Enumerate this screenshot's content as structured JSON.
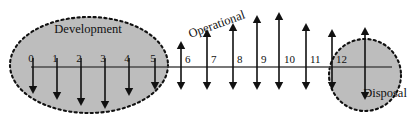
{
  "diagram": {
    "width": 416,
    "height": 126,
    "background_color": "#ffffff",
    "ink_color": "#111111",
    "axis_color": "#4a4a4a",
    "phase_fill_color": "#bdbdbd",
    "phase_border_style": "dashed"
  },
  "axis": {
    "name": "lifecycle-timeline-axis",
    "y": 67,
    "x_start": 31,
    "x_end": 392
  },
  "phases": [
    {
      "id": "development",
      "label": "Development",
      "shape": "ellipse",
      "cx": 89,
      "cy": 65,
      "rx": 79,
      "ry": 48,
      "label_x": 88,
      "label_y": 33,
      "label_rotation": 0
    },
    {
      "id": "operational",
      "label": "Operational",
      "shape": "none",
      "label_x": 218,
      "label_y": 28,
      "label_rotation": -20
    },
    {
      "id": "disposal",
      "label": "Disposal",
      "shape": "circle",
      "cx": 365,
      "cy": 75,
      "rx": 36,
      "ry": 36,
      "label_x": 385,
      "label_y": 97,
      "label_rotation": 0
    }
  ],
  "ticks": [
    {
      "label": "0",
      "x": 33,
      "label_x": 31,
      "label_y": 62,
      "arrow_type": "down",
      "up_length": 0,
      "down_length": 27,
      "phase": "development"
    },
    {
      "label": "1",
      "x": 57,
      "label_x": 55,
      "label_y": 62,
      "arrow_type": "down",
      "up_length": 0,
      "down_length": 33,
      "phase": "development"
    },
    {
      "label": "2",
      "x": 81,
      "label_x": 79,
      "label_y": 62,
      "arrow_type": "down",
      "up_length": 0,
      "down_length": 39,
      "phase": "development"
    },
    {
      "label": "3",
      "x": 105,
      "label_x": 103,
      "label_y": 62,
      "arrow_type": "down",
      "up_length": 0,
      "down_length": 42,
      "phase": "development"
    },
    {
      "label": "4",
      "x": 129,
      "label_x": 127,
      "label_y": 62,
      "arrow_type": "down",
      "up_length": 0,
      "down_length": 29,
      "phase": "development"
    },
    {
      "label": "5",
      "x": 155,
      "label_x": 153,
      "label_y": 62,
      "arrow_type": "down",
      "up_length": 0,
      "down_length": 23,
      "phase": "development"
    },
    {
      "label": "6",
      "x": 181,
      "label_x": 185,
      "label_y": 63,
      "arrow_type": "double",
      "up_length": 26,
      "down_length": 23,
      "phase": "operational"
    },
    {
      "label": "7",
      "x": 207,
      "label_x": 211,
      "label_y": 63,
      "arrow_type": "double",
      "up_length": 38,
      "down_length": 23,
      "phase": "operational"
    },
    {
      "label": "8",
      "x": 233,
      "label_x": 237,
      "label_y": 63,
      "arrow_type": "double",
      "up_length": 44,
      "down_length": 23,
      "phase": "operational"
    },
    {
      "label": "9",
      "x": 257,
      "label_x": 261,
      "label_y": 63,
      "arrow_type": "double",
      "up_length": 52,
      "down_length": 23,
      "phase": "operational"
    },
    {
      "label": "10",
      "x": 279,
      "label_x": 284,
      "label_y": 63,
      "arrow_type": "double",
      "up_length": 55,
      "down_length": 23,
      "phase": "operational"
    },
    {
      "label": "11",
      "x": 306,
      "label_x": 310,
      "label_y": 63,
      "arrow_type": "double",
      "up_length": 44,
      "down_length": 23,
      "phase": "operational"
    },
    {
      "label": "12",
      "x": 332,
      "label_x": 336,
      "label_y": 63,
      "arrow_type": "double",
      "up_length": 38,
      "down_length": 23,
      "phase": "operational"
    },
    {
      "label": "",
      "x": 365,
      "label_x": 0,
      "label_y": 0,
      "arrow_type": "double",
      "up_length": 40,
      "down_length": 33,
      "phase": "disposal"
    }
  ]
}
